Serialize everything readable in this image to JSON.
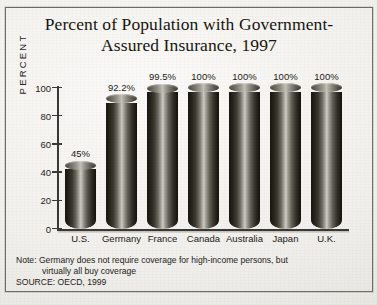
{
  "chart_data": {
    "type": "bar",
    "title_line1": "Percent of Population with Government-",
    "title_line2": "Assured Insurance, 1997",
    "xlabel": "",
    "ylabel": "PERCENT",
    "ylim": [
      0,
      100
    ],
    "yticks": [
      100,
      80,
      60,
      40,
      20,
      0
    ],
    "grid": false,
    "legend": "none",
    "categories": [
      "U.S.",
      "Germany",
      "France",
      "Canada",
      "Australia",
      "Japan",
      "U.K."
    ],
    "values": [
      45,
      92.2,
      99.5,
      100,
      100,
      100,
      100
    ],
    "value_labels": [
      "45%",
      "92.2%",
      "99.5%",
      "100%",
      "100%",
      "100%",
      "100%"
    ],
    "note_line1": "Note: Germany does not require coverage for high-income persons, but",
    "note_line2": "virtually all buy coverage",
    "source": "SOURCE: OECD, 1999"
  },
  "colors": {
    "paper": "#f1efeb",
    "ink": "#1b1a15",
    "axis": "#3a3933",
    "bar_dark": "#17160f",
    "bar_highlight": "#cfccc4"
  }
}
